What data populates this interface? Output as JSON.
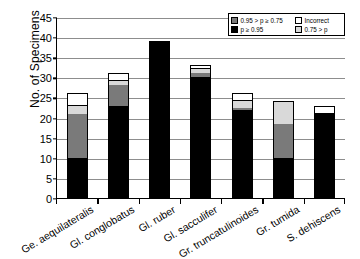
{
  "chart_data": {
    "type": "bar",
    "subtype": "stacked-vertical",
    "title": "",
    "xlabel": "",
    "ylabel": "No. of Specimens",
    "ylim": [
      0,
      45
    ],
    "ytick_step": 5,
    "yticks": [
      0,
      5,
      10,
      15,
      20,
      25,
      30,
      35,
      40,
      45
    ],
    "grid": "horizontal",
    "legend_position": "top-right",
    "categories": [
      "Ge. aequilateralis",
      "Gl. conglobatus",
      "Gl. ruber",
      "Gl. sacculifer",
      "Gr. truncatulinoides",
      "Gr. tumida",
      "S. dehiscens"
    ],
    "series": [
      {
        "name": "p ≥ 0.95",
        "color": "#000000",
        "values": [
          10,
          23,
          39,
          30,
          22,
          10,
          21
        ]
      },
      {
        "name": "0.95 > p ≥ 0.75",
        "color": "#7a7a7a",
        "values": [
          11,
          5,
          0,
          1,
          0.5,
          8.5,
          0
        ]
      },
      {
        "name": "0.75 > p",
        "color": "#d9d9d9",
        "values": [
          2,
          1,
          0,
          1,
          1.5,
          5.5,
          0
        ]
      },
      {
        "name": "Incorrect",
        "color": "#ffffff",
        "values": [
          3,
          2,
          0,
          1,
          2,
          0,
          2
        ]
      }
    ],
    "totals": [
      26,
      31,
      39,
      33,
      26,
      24,
      23
    ]
  },
  "legend": {
    "entries": [
      {
        "label": "0.95 > p ≥ 0.75",
        "swatch": "gray"
      },
      {
        "label": "Incorrect",
        "swatch": "white"
      },
      {
        "label": "p ≥ 0.95",
        "swatch": "black"
      },
      {
        "label": "0.75 > p",
        "swatch": "ltgray"
      }
    ]
  }
}
